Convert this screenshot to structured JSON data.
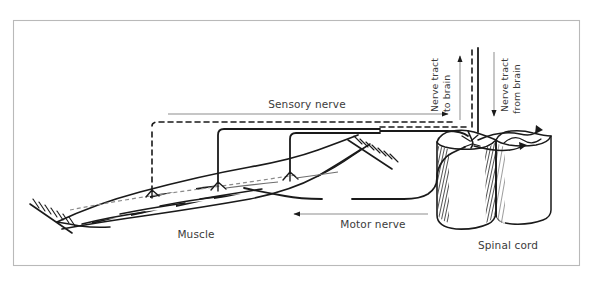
{
  "figure": {
    "frame": {
      "visible": true,
      "color": "#b9b9b9"
    },
    "background": "#ffffff",
    "ink_color": "#1a1a1a",
    "guide_color": "#8d8d8d",
    "text_color": "#3b3b3b"
  },
  "labels": {
    "sensory_nerve": "Sensory nerve",
    "motor_nerve": "Motor nerve",
    "muscle": "Muscle",
    "spinal_cord": "Spinal cord",
    "nerve_tract_to_brain": "Nerve tract\nto brain",
    "nerve_tract_to_brain_line1": "Nerve tract",
    "nerve_tract_to_brain_line2": "to brain",
    "nerve_tract_from_brain_line1": "Nerve tract",
    "nerve_tract_from_brain_line2": "from brain"
  },
  "arrows": {
    "sensory": {
      "direction": "right",
      "from_x": 168,
      "to_x": 456,
      "y": 114
    },
    "motor": {
      "direction": "left",
      "from_x": 428,
      "to_x": 288,
      "y": 214
    },
    "to_brain": {
      "direction": "up",
      "x": 460,
      "from_y": 122,
      "to_y": 52
    },
    "from_brain": {
      "direction": "down",
      "x": 494,
      "from_y": 52,
      "to_y": 122
    }
  },
  "parts": [
    {
      "name": "muscle",
      "label": "Muscle"
    },
    {
      "name": "sensory-nerve",
      "label": "Sensory nerve",
      "line_style": "dashed"
    },
    {
      "name": "motor-nerve",
      "label": "Motor nerve",
      "line_style": "solid"
    },
    {
      "name": "spinal-cord",
      "label": "Spinal cord"
    },
    {
      "name": "nerve-tract-to-brain",
      "label": "Nerve tract to brain"
    },
    {
      "name": "nerve-tract-from-brain",
      "label": "Nerve tract from brain"
    }
  ]
}
